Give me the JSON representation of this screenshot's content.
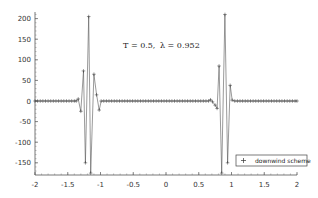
{
  "chart_data": {
    "type": "line",
    "title": "",
    "annotation": "T = 0.5,    λ = 0.952",
    "annotation_parts": {
      "T": "T = 0.5,",
      "lambda": "λ = 0.952"
    },
    "xlabel": "",
    "ylabel": "",
    "xlim": [
      -2,
      2
    ],
    "ylim": [
      -175,
      215
    ],
    "xticks": [
      -2,
      -1.5,
      -1,
      -0.5,
      0,
      0.5,
      1,
      1.5,
      2
    ],
    "xtick_labels": [
      "-2",
      "-1.5",
      "-1",
      "-0.5",
      "0",
      "0.5",
      "1",
      "1.5",
      "2"
    ],
    "yticks": [
      -150,
      -100,
      -50,
      0,
      50,
      100,
      150,
      200
    ],
    "ytick_labels": [
      "-150",
      "-100",
      "-50",
      "0",
      "50",
      "100",
      "150",
      "200"
    ],
    "grid": false,
    "legend_position": "lower right",
    "legend": [
      {
        "marker": "+",
        "label": "downwind scheme"
      }
    ],
    "series": [
      {
        "name": "downwind scheme",
        "marker": "+",
        "color": "#555555",
        "x": [
          -2.0,
          -1.96,
          -1.92,
          -1.88,
          -1.84,
          -1.8,
          -1.76,
          -1.72,
          -1.68,
          -1.64,
          -1.6,
          -1.56,
          -1.52,
          -1.48,
          -1.44,
          -1.4,
          -1.37,
          -1.34,
          -1.3,
          -1.26,
          -1.23,
          -1.18,
          -1.15,
          -1.1,
          -1.06,
          -1.02,
          -0.99,
          -0.95,
          -0.91,
          -0.87,
          -0.83,
          -0.79,
          -0.75,
          -0.71,
          -0.67,
          -0.63,
          -0.59,
          -0.55,
          -0.51,
          -0.47,
          -0.43,
          -0.39,
          -0.35,
          -0.31,
          -0.27,
          -0.23,
          -0.19,
          -0.15,
          -0.11,
          -0.07,
          -0.03,
          0.01,
          0.05,
          0.09,
          0.13,
          0.17,
          0.21,
          0.25,
          0.29,
          0.33,
          0.37,
          0.41,
          0.45,
          0.49,
          0.53,
          0.57,
          0.61,
          0.65,
          0.68,
          0.71,
          0.75,
          0.78,
          0.81,
          0.85,
          0.9,
          0.94,
          0.98,
          1.01,
          1.05,
          1.09,
          1.13,
          1.17,
          1.21,
          1.25,
          1.29,
          1.33,
          1.37,
          1.41,
          1.45,
          1.49,
          1.53,
          1.57,
          1.61,
          1.65,
          1.69,
          1.73,
          1.77,
          1.81,
          1.85,
          1.89,
          1.93,
          1.97,
          2.0
        ],
        "y": [
          0,
          0,
          0,
          0,
          0,
          0,
          0,
          0,
          0,
          0,
          0,
          0,
          0,
          0,
          0,
          0,
          0,
          5,
          -25,
          73,
          -150,
          205,
          -175,
          65,
          15,
          -22,
          0,
          0,
          0,
          0,
          0,
          0,
          0,
          0,
          0,
          0,
          0,
          0,
          0,
          0,
          0,
          0,
          0,
          0,
          0,
          0,
          0,
          0,
          0,
          0,
          0,
          0,
          0,
          0,
          0,
          0,
          0,
          0,
          0,
          0,
          0,
          0,
          0,
          0,
          0,
          0,
          0,
          0,
          3,
          -2,
          -10,
          -18,
          85,
          -175,
          210,
          -150,
          38,
          2,
          0,
          0,
          0,
          0,
          0,
          0,
          0,
          0,
          0,
          0,
          0,
          0,
          0,
          0,
          0,
          0,
          0,
          0,
          0,
          0,
          0,
          0,
          0,
          0,
          0
        ]
      }
    ]
  }
}
